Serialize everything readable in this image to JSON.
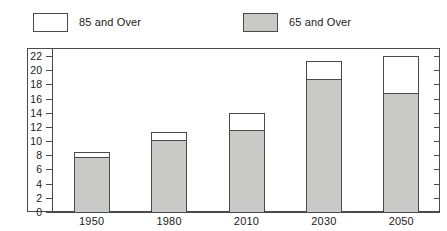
{
  "legend": {
    "entries": [
      {
        "label": "85 and Over",
        "swatch": "white",
        "color": "#ffffff",
        "name": "legend-85-and-over"
      },
      {
        "label": "65 and Over",
        "swatch": "gray",
        "color": "#c9c9c7",
        "name": "legend-65-and-over"
      }
    ]
  },
  "axes": {
    "y_ticks": [
      "0",
      "2",
      "4",
      "6",
      "8",
      "10",
      "12",
      "14",
      "16",
      "18",
      "20",
      "22"
    ],
    "x_ticks": [
      "1950",
      "1980",
      "2010",
      "2030",
      "2050"
    ]
  },
  "chart_data": {
    "type": "bar",
    "title": "",
    "subtitle": "",
    "xlabel": "",
    "ylabel": "",
    "stacked": true,
    "grid": false,
    "legend_position": "top",
    "categories": [
      "1950",
      "1980",
      "2010",
      "2030",
      "2050"
    ],
    "ylim": [
      0,
      22
    ],
    "ytick_step": 2,
    "series": [
      {
        "name": "65 and Over",
        "color": "#c9c9c7",
        "values": [
          7.8,
          10.2,
          11.5,
          18.8,
          16.8
        ]
      },
      {
        "name": "85 and Over",
        "color": "#ffffff",
        "values": [
          0.6,
          1.1,
          2.4,
          2.5,
          5.2
        ]
      }
    ],
    "totals": [
      8.4,
      11.3,
      13.9,
      21.3,
      22.0
    ],
    "annotations": []
  },
  "style": {
    "line_color": "#4a4a4a",
    "gray_fill": "#c9c9c7",
    "white_fill": "#ffffff",
    "background": "#ffffff"
  }
}
